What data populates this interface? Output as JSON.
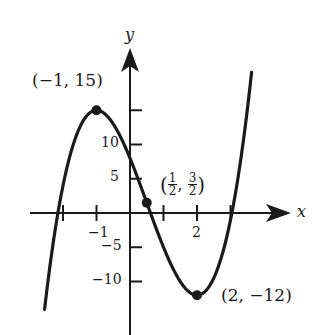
{
  "chart_data": {
    "type": "line",
    "title": "",
    "function": "f(x) = 2x^3 - 3x^2 - 12x + 8",
    "xlabel": "x",
    "ylabel": "y",
    "x_ticks": [
      -2,
      -1,
      1,
      2,
      3
    ],
    "x_tick_labels": [
      {
        "value": -1,
        "label": "−1"
      },
      {
        "value": 2,
        "label": "2"
      }
    ],
    "y_ticks": [
      -10,
      -5,
      5,
      10,
      15
    ],
    "y_tick_labels": [
      {
        "value": 10,
        "label": "10"
      },
      {
        "value": 5,
        "label": "5"
      },
      {
        "value": -5,
        "label": "−5"
      },
      {
        "value": -10,
        "label": "−10"
      }
    ],
    "xlim": [
      -2.5,
      3.5
    ],
    "ylim": [
      -15,
      20
    ],
    "grid": false,
    "points": [
      {
        "x": -1,
        "y": 15,
        "label": "(−1, 15)",
        "kind": "local maximum"
      },
      {
        "x": 0.5,
        "y": 1.5,
        "label": "(1/2, 3/2)",
        "kind": "inflection point"
      },
      {
        "x": 2,
        "y": -12,
        "label": "(2, −12)",
        "kind": "local minimum"
      }
    ],
    "series": [
      {
        "name": "f(x)",
        "x_range": [
          -2.55,
          3.65
        ],
        "color": "#1a1a1a"
      }
    ]
  },
  "labels": {
    "max_point": "(−1, 15)",
    "min_point": "(2, −12)",
    "inflection_open": "(",
    "inflection_num1": "1",
    "inflection_den1": "2",
    "inflection_comma": ",",
    "inflection_num2": "3",
    "inflection_den2": "2",
    "inflection_close": ")",
    "x_axis": "x",
    "y_axis": "y",
    "tick_x_neg1": "−1",
    "tick_x_2": "2",
    "tick_y_10": "10",
    "tick_y_5": "5",
    "tick_y_neg5": "−5",
    "tick_y_neg10": "−10"
  },
  "colors": {
    "ink": "#1a1a1a",
    "background": "#ffffff"
  }
}
